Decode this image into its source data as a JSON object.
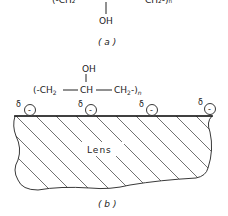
{
  "panel_a": {
    "formula_top_partial": "(-CH2 — CH — CH2-)n",
    "substituent": "OH",
    "caption": "( a )"
  },
  "panel_b": {
    "substituent": "OH",
    "formula": {
      "open": "(-CH",
      "sub2a": "2",
      "mid": "CH",
      "ch2": "CH",
      "sub2b": "2",
      "close": "-)",
      "n": "n"
    },
    "charge_labels": [
      "δ",
      "δ",
      "δ",
      "δ"
    ],
    "charge_sign": "-",
    "lens_label": "Lens",
    "caption": "( b )"
  }
}
